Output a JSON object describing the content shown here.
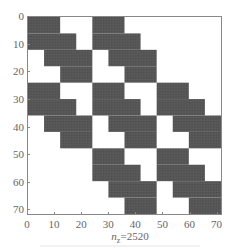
{
  "chart_data": {
    "type": "heatmap",
    "subtype": "sparsity-pattern",
    "title": "",
    "xlabel": "n_z=2520",
    "xlabel_var": "n",
    "xlabel_sub": "z",
    "xlabel_value": "=2520",
    "ylabel": "",
    "matrix_size": [
      72,
      72
    ],
    "xlim": [
      0,
      72
    ],
    "ylim": [
      72,
      0
    ],
    "x_ticks": [
      0,
      10,
      20,
      30,
      40,
      50,
      60,
      70
    ],
    "y_ticks": [
      0,
      10,
      20,
      30,
      40,
      50,
      60,
      70
    ],
    "grid": false,
    "nonzero_color": "#555555",
    "block_size": 24,
    "block_pattern": [
      [
        1,
        1,
        0
      ],
      [
        1,
        1,
        1
      ],
      [
        0,
        1,
        1
      ]
    ],
    "intra_block_staircase": [
      {
        "rows": [
          0,
          6
        ],
        "cols": [
          0,
          12
        ]
      },
      {
        "rows": [
          6,
          12
        ],
        "cols": [
          0,
          18
        ]
      },
      {
        "rows": [
          12,
          18
        ],
        "cols": [
          6,
          24
        ]
      },
      {
        "rows": [
          18,
          24
        ],
        "cols": [
          12,
          24
        ]
      }
    ],
    "nonzeros": 2520
  }
}
